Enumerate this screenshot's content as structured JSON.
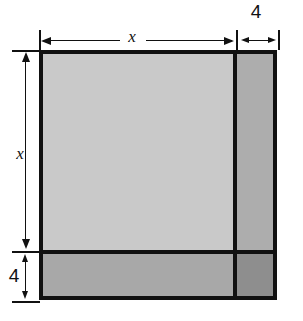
{
  "figure": {
    "type": "geometry-diagram",
    "background_color": "#ffffff",
    "outline_color": "#111111"
  },
  "regions": [
    {
      "id": "main",
      "name": "large-square-region",
      "fill": "#c9c9c9",
      "width_label": "x",
      "height_label": "x"
    },
    {
      "id": "right-strip",
      "name": "right-vertical-strip",
      "fill": "#adadad",
      "width_label": "4",
      "height_label": "x"
    },
    {
      "id": "bottom-strip",
      "name": "bottom-horizontal-strip",
      "fill": "#a8a8a8",
      "width_label": "x",
      "height_label": "4"
    },
    {
      "id": "corner",
      "name": "bottom-right-corner-square",
      "fill": "#8e8e8e",
      "width_label": "4",
      "height_label": "4"
    }
  ],
  "dimensions": {
    "top_primary": {
      "label": "x",
      "orientation": "horizontal",
      "position": "top",
      "spans": "large-square-width"
    },
    "top_secondary": {
      "label": "4",
      "orientation": "horizontal",
      "position": "top",
      "spans": "right-strip-width"
    },
    "left_primary": {
      "label": "x",
      "orientation": "vertical",
      "position": "left",
      "spans": "large-square-height"
    },
    "left_secondary": {
      "label": "4",
      "orientation": "vertical",
      "position": "left",
      "spans": "bottom-strip-height"
    }
  }
}
